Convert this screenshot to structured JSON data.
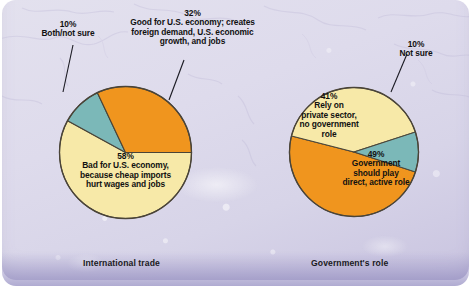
{
  "figure": {
    "background_color": "#ded9ec",
    "colors": {
      "orange": "#F0951E",
      "yellow": "#F7E9A8",
      "teal": "#7BB8B8",
      "outline": "#4a4438",
      "text": "#111111"
    }
  },
  "chart_data": [
    {
      "type": "pie",
      "title": "International trade",
      "categories": [
        "Bad for U.S. economy, because cheap imports hurt wages and jobs",
        "Good for U.S. economy; creates foreign demand, U.S. economic growth, and jobs",
        "Both/not sure"
      ],
      "values": [
        58,
        32,
        10
      ],
      "value_suffix": "%",
      "colors": [
        "#F7E9A8",
        "#F0951E",
        "#7BB8B8"
      ],
      "legend": "none",
      "grid": false,
      "labels": [
        {
          "pct": "58%",
          "lines": [
            "Bad for U.S. economy,",
            "because cheap imports",
            "hurt wages and jobs"
          ],
          "placement": "inside"
        },
        {
          "pct": "32%",
          "lines": [
            "Good for U.S. economy; creates",
            "foreign demand, U.S. economic",
            "growth, and jobs"
          ],
          "placement": "outside-leader"
        },
        {
          "pct": "10%",
          "lines": [
            "Both/not sure"
          ],
          "placement": "outside-leader"
        }
      ]
    },
    {
      "type": "pie",
      "title": "Government's role",
      "categories": [
        "Government should play direct, active role",
        "Rely on private sector, no government role",
        "Not sure"
      ],
      "values": [
        49,
        41,
        10
      ],
      "value_suffix": "%",
      "colors": [
        "#F0951E",
        "#F7E9A8",
        "#7BB8B8"
      ],
      "legend": "none",
      "grid": false,
      "labels": [
        {
          "pct": "49%",
          "lines": [
            "Government",
            "should play",
            "direct, active role"
          ],
          "placement": "inside"
        },
        {
          "pct": "41%",
          "lines": [
            "Rely on",
            "private sector,",
            "no government",
            "role"
          ],
          "placement": "inside"
        },
        {
          "pct": "10%",
          "lines": [
            "Not sure"
          ],
          "placement": "outside-leader"
        }
      ]
    }
  ],
  "left_chart": {
    "caption": "International trade",
    "label_bad": {
      "pct": "58%",
      "l1": "Bad for U.S. economy,",
      "l2": "because cheap imports",
      "l3": "hurt wages and jobs"
    },
    "label_good": {
      "pct": "32%",
      "l1": "Good for U.S. economy; creates",
      "l2": "foreign demand, U.S. economic",
      "l3": "growth, and jobs"
    },
    "label_both": {
      "pct": "10%",
      "l1": "Both/not sure"
    }
  },
  "right_chart": {
    "caption": "Government's role",
    "label_gov": {
      "pct": "49%",
      "l1": "Government",
      "l2": "should play",
      "l3": "direct, active role"
    },
    "label_private": {
      "pct": "41%",
      "l1": "Rely on",
      "l2": "private sector,",
      "l3": "no government",
      "l4": "role"
    },
    "label_notsure": {
      "pct": "10%",
      "l1": "Not sure"
    }
  }
}
